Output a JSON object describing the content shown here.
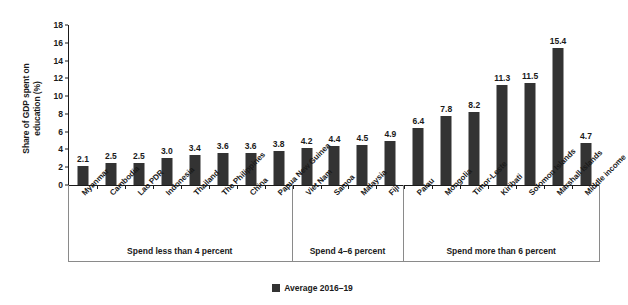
{
  "chart_data": {
    "type": "bar",
    "title": "",
    "subtitle": "",
    "xlabel": "",
    "ylabel": "Share of GDP spent on\neducation (%)",
    "ylim": [
      0,
      18
    ],
    "yticks": [
      0,
      2,
      4,
      6,
      8,
      10,
      12,
      14,
      16,
      18
    ],
    "grid": false,
    "legend_position": "bottom-center",
    "legend": [
      "Average 2016–19"
    ],
    "series_color": "#333333",
    "categories": [
      "Myanmar",
      "Cambodia",
      "Lao PDR",
      "Indonesia",
      "Thailand",
      "The Philippines",
      "China",
      "Papua New Guinea",
      "Viet Nam",
      "Samoa",
      "Malaysia",
      "Fiji",
      "Palau",
      "Mongolia",
      "Timor-Leste",
      "Kiribati",
      "Solomon Islands",
      "Marshall Islands",
      "Middle income"
    ],
    "values": [
      2.1,
      2.5,
      2.5,
      3.0,
      3.4,
      3.6,
      3.6,
      3.8,
      4.2,
      4.4,
      4.5,
      4.9,
      6.4,
      7.8,
      8.2,
      11.3,
      11.5,
      15.4,
      4.7
    ],
    "series": [
      {
        "name": "Average 2016–19",
        "values": [
          2.1,
          2.5,
          2.5,
          3.0,
          3.4,
          3.6,
          3.6,
          3.8,
          4.2,
          4.4,
          4.5,
          4.9,
          6.4,
          7.8,
          8.2,
          11.3,
          11.5,
          15.4,
          4.7
        ]
      }
    ],
    "groups": [
      {
        "label": "Spend less than 4 percent",
        "start": 0,
        "end": 7
      },
      {
        "label": "Spend 4–6 percent",
        "start": 8,
        "end": 11
      },
      {
        "label": "Spend more than 6 percent",
        "start": 12,
        "end": 18
      }
    ]
  }
}
